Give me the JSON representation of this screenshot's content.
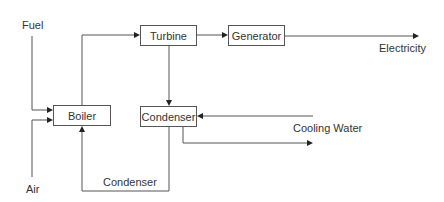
{
  "diagram": {
    "type": "power plant flow diagram",
    "nodes": [
      {
        "id": "boiler",
        "label": "Boiler"
      },
      {
        "id": "turbine",
        "label": "Turbine"
      },
      {
        "id": "generator",
        "label": "Generator"
      },
      {
        "id": "condenser",
        "label": "Condenser"
      }
    ],
    "inputs": {
      "fuel": "Fuel",
      "air": "Air",
      "cooling_water": "Cooling Water"
    },
    "outputs": {
      "electricity": "Electricity"
    },
    "edge_labels": {
      "return": "Condenser"
    },
    "edges": [
      {
        "from": "Fuel",
        "to": "Boiler"
      },
      {
        "from": "Air",
        "to": "Boiler"
      },
      {
        "from": "Boiler",
        "to": "Turbine"
      },
      {
        "from": "Turbine",
        "to": "Generator"
      },
      {
        "from": "Generator",
        "to": "Electricity"
      },
      {
        "from": "Turbine",
        "to": "Condenser"
      },
      {
        "from": "Cooling Water",
        "to": "Condenser"
      },
      {
        "from": "Condenser",
        "to": "Cooling Water out"
      },
      {
        "from": "Condenser",
        "to": "Boiler",
        "label": "Condenser"
      }
    ],
    "colors": {
      "line": "#555555",
      "text": "#333333",
      "background": "#ffffff"
    }
  }
}
